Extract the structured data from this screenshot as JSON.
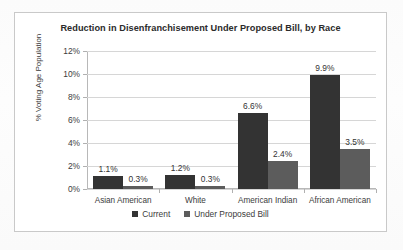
{
  "chart_data": {
    "type": "bar",
    "title": "Reduction in Disenfranchisement Under Proposed Bill, by Race",
    "xlabel": "",
    "ylabel": "% Voting Age Population",
    "categories": [
      "Asian American",
      "White",
      "American Indian",
      "African American"
    ],
    "series": [
      {
        "name": "Current",
        "color": "#333333",
        "values": [
          1.1,
          1.2,
          6.6,
          9.9
        ],
        "labels": [
          "1.1%",
          "1.2%",
          "6.6%",
          "9.9%"
        ]
      },
      {
        "name": "Under Proposed Bill",
        "color": "#5c5c5c",
        "values": [
          0.3,
          0.3,
          2.4,
          3.5
        ],
        "labels": [
          "0.3%",
          "0.3%",
          "2.4%",
          "3.5%"
        ]
      }
    ],
    "ylim": [
      0,
      12
    ],
    "ytick_values": [
      0,
      2,
      4,
      6,
      8,
      10,
      12
    ],
    "ytick_labels": [
      "0%",
      "2%",
      "4%",
      "6%",
      "8%",
      "10%",
      "12%"
    ],
    "grid": true,
    "legend_position": "bottom"
  }
}
